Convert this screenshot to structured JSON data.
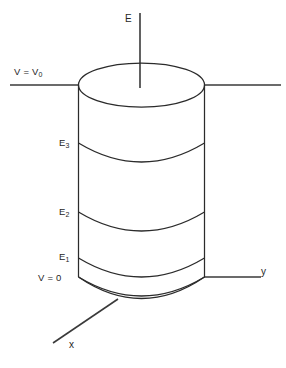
{
  "figure": {
    "background_color": "#ffffff",
    "line_color": "#2b2b2b",
    "text_color": "#262626",
    "width": 286,
    "height": 368
  },
  "axes": [
    {
      "id": "axis-e",
      "label": "E",
      "orientation": "vertical"
    },
    {
      "id": "axis-y",
      "label": "y",
      "orientation": "horizontal-right"
    },
    {
      "id": "axis-x",
      "label": "x",
      "orientation": "diagonal-lower-left"
    }
  ],
  "boundary_conditions": [
    {
      "id": "bc-top",
      "text_html": "V = V<sub>0</sub>",
      "text": "V = V0",
      "position": "top"
    },
    {
      "id": "bc-bottom",
      "text_html": "V = 0",
      "text": "V = 0",
      "position": "bottom"
    }
  ],
  "bands": [
    {
      "id": "band-e3",
      "text_html": "E<sub>3</sub>",
      "text": "E3"
    },
    {
      "id": "band-e2",
      "text_html": "E<sub>2</sub>",
      "text": "E2"
    },
    {
      "id": "band-e1",
      "text_html": "E<sub>1</sub>",
      "text": "E1"
    }
  ],
  "labels": {
    "e_axis": "E",
    "y_axis": "y",
    "x_axis": "x",
    "v_top": "V = V",
    "v_top_sub": "0",
    "v_bottom": "V = 0",
    "e3": "E",
    "e3_sub": "3",
    "e2": "E",
    "e2_sub": "2",
    "e1": "E",
    "e1_sub": "1"
  }
}
